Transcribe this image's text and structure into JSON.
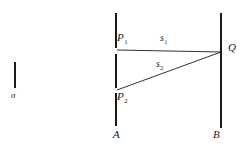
{
  "figure": {
    "type": "optics-two-slit-path-diagram",
    "background_color": "#ffffff",
    "stroke_color": "#1a1a1a",
    "labels": {
      "source": "σ",
      "slit_top": "P",
      "slit_top_sub": "1",
      "slit_bottom": "P",
      "slit_bottom_sub": "2",
      "path_top": "s",
      "path_top_sub": "1",
      "path_bottom": "s",
      "path_bottom_sub": "2",
      "observation_point": "Q",
      "screen_left": "A",
      "screen_right": "B"
    },
    "geometry": {
      "source_line": {
        "x": 15,
        "y1": 62,
        "y2": 88
      },
      "barrier_A_x": 116,
      "barrier_A_segments": [
        {
          "y1": 13,
          "y2": 48
        },
        {
          "y1": 54,
          "y2": 88
        },
        {
          "y1": 93,
          "y2": 126
        }
      ],
      "screen_B": {
        "x": 221,
        "y1": 13,
        "y2": 128
      },
      "ray_s1": {
        "x1": 117,
        "y1": 50,
        "x2": 221,
        "y2": 52
      },
      "ray_s2": {
        "x1": 117,
        "y1": 90,
        "x2": 221,
        "y2": 52
      }
    }
  }
}
